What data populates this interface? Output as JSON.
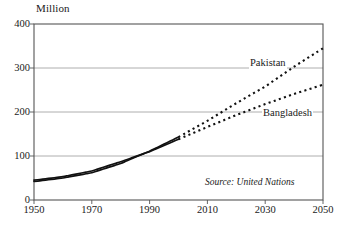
{
  "chart_data": {
    "type": "line",
    "title": "",
    "subtitle": "",
    "xlabel": "",
    "ylabel": "Million",
    "unit_title": "Million",
    "xlim": [
      1950,
      2050
    ],
    "ylim": [
      0,
      400
    ],
    "grid": "horizontal",
    "legend_position": "inline-end-of-series",
    "x_ticks": [
      "1950",
      "1970",
      "1990",
      "2010",
      "2030",
      "2050"
    ],
    "x_tick_values": [
      1950,
      1970,
      1990,
      2010,
      2030,
      2050
    ],
    "y_ticks": [
      "0",
      "100",
      "200",
      "300",
      "400"
    ],
    "y_tick_values": [
      0,
      100,
      200,
      300,
      400
    ],
    "historical_end_year": 2000,
    "annotations": [
      {
        "name": "source-note",
        "text": "Source: United Nations",
        "style": "italic"
      }
    ],
    "series": [
      {
        "name": "Pakistan",
        "label": "Pakistan",
        "style_historical": "solid",
        "style_projection": "dotted",
        "x": [
          1950,
          1960,
          1970,
          1980,
          1990,
          2000,
          2010,
          2020,
          2030,
          2040,
          2050
        ],
        "values": [
          42,
          50,
          62,
          83,
          111,
          143,
          180,
          220,
          258,
          303,
          345
        ]
      },
      {
        "name": "Bangladesh",
        "label": "Bangladesh",
        "style_historical": "solid",
        "style_projection": "dotted",
        "x": [
          1950,
          1960,
          1970,
          1980,
          1990,
          2000,
          2010,
          2020,
          2030,
          2040,
          2050
        ],
        "values": [
          45,
          53,
          66,
          87,
          110,
          138,
          166,
          193,
          218,
          241,
          262
        ]
      }
    ]
  },
  "colors": {
    "line": "#111111",
    "frame": "#555555",
    "grid": "#9a9a9a",
    "background": "#ffffff"
  }
}
